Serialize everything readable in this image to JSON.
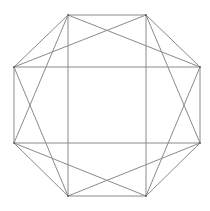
{
  "figure": {
    "shape": "octagon",
    "vertex_count": 8,
    "vertices": [
      "A",
      "B",
      "C",
      "D",
      "E",
      "F",
      "G",
      "H"
    ],
    "edges": [
      [
        "A",
        "B"
      ],
      [
        "B",
        "C"
      ],
      [
        "C",
        "D"
      ],
      [
        "D",
        "E"
      ],
      [
        "E",
        "F"
      ],
      [
        "F",
        "G"
      ],
      [
        "G",
        "H"
      ],
      [
        "H",
        "A"
      ]
    ],
    "chords": [
      [
        "A",
        "F"
      ],
      [
        "B",
        "E"
      ],
      [
        "H",
        "C"
      ],
      [
        "G",
        "D"
      ],
      [
        "A",
        "C"
      ],
      [
        "C",
        "E"
      ],
      [
        "E",
        "G"
      ],
      [
        "G",
        "A"
      ],
      [
        "B",
        "D"
      ],
      [
        "D",
        "F"
      ],
      [
        "F",
        "H"
      ],
      [
        "H",
        "B"
      ]
    ],
    "line_color": "#8a8a8a"
  }
}
